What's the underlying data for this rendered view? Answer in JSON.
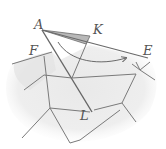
{
  "diagram": {
    "type": "hand-drawn geometric sketch",
    "labels": {
      "A": "A",
      "K": "K",
      "F": "F",
      "E": "E",
      "L": "L"
    },
    "colors": {
      "background": "#ffffff",
      "shading": "#e6e6e6",
      "shading_dark": "#d4d4d4",
      "stroke": "#8a8a8a",
      "stroke_dark": "#6a6a6a",
      "wedge": "#b8b8b8",
      "label": "#555555"
    },
    "arrow": {
      "from": "near A",
      "to": "near E",
      "style": "curved"
    }
  }
}
